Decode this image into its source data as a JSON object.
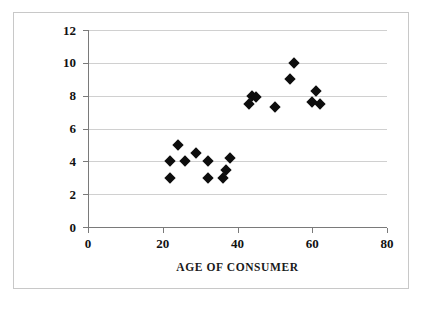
{
  "chart_data": {
    "type": "scatter",
    "title": "",
    "xlabel": "AGE OF CONSUMER",
    "ylabel": "PREFERENCE FOR BRAND A",
    "xlim": [
      0,
      80
    ],
    "ylim": [
      0,
      12
    ],
    "xticks": [
      0,
      20,
      40,
      60,
      80
    ],
    "yticks": [
      0,
      2,
      4,
      6,
      8,
      10,
      12
    ],
    "xtick_labels": [
      "0",
      "20",
      "40",
      "60",
      "80"
    ],
    "ytick_labels": [
      "0",
      "2",
      "4",
      "6",
      "8",
      "10",
      "12"
    ],
    "grid": "horizontal",
    "legend": "none",
    "marker": "diamond",
    "marker_color": "#0d0d0d",
    "series": [
      {
        "name": "consumers",
        "points": [
          [
            22,
            4.0
          ],
          [
            22,
            3.0
          ],
          [
            24,
            5.0
          ],
          [
            26,
            4.0
          ],
          [
            29,
            4.5
          ],
          [
            32,
            4.0
          ],
          [
            32,
            3.0
          ],
          [
            36,
            3.0
          ],
          [
            37,
            3.5
          ],
          [
            38,
            4.2
          ],
          [
            43,
            7.5
          ],
          [
            44,
            8.0
          ],
          [
            45,
            7.9
          ],
          [
            50,
            7.3
          ],
          [
            54,
            9.0
          ],
          [
            55,
            10.0
          ],
          [
            60,
            7.6
          ],
          [
            61,
            8.3
          ],
          [
            62,
            7.5
          ]
        ]
      }
    ]
  },
  "colors": {
    "marker": "#0d0d0d",
    "grid": "#d0d0d0",
    "axis": "#7a7a7a",
    "frame": "#c8c8c8",
    "text": "#111111",
    "background": "#ffffff"
  }
}
